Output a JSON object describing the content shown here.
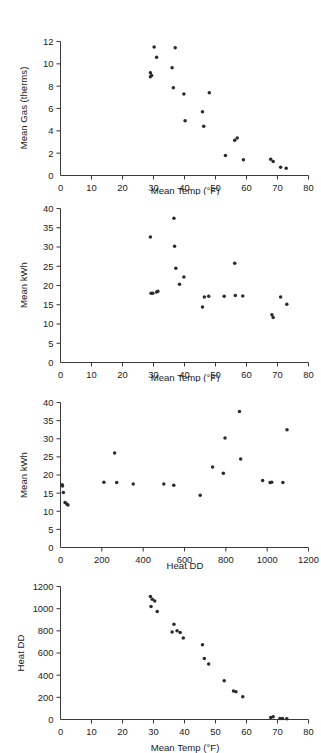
{
  "figure": {
    "name": "four-panel-scatter-figure",
    "background": "#ffffff",
    "point_color": "#2b2b2b",
    "axis_color": "#3a3a3a"
  },
  "chart_data": [
    {
      "type": "scatter",
      "title": "",
      "xlabel": "Mean Temp (°F)",
      "ylabel": "Mean Gas (therms)",
      "xlim": [
        0,
        80
      ],
      "ylim": [
        0,
        12
      ],
      "xticks": [
        0,
        10,
        20,
        30,
        40,
        50,
        60,
        70,
        80
      ],
      "yticks": [
        0,
        2,
        4,
        6,
        8,
        10,
        12
      ],
      "xtick_labels": [
        "0",
        "10",
        "20",
        "30",
        "40",
        "50",
        "60",
        "70",
        "80"
      ],
      "ytick_labels": [
        "0",
        "2",
        "4",
        "6",
        "8",
        "10",
        "12"
      ],
      "grid": false,
      "legend": false,
      "x": [
        29.0,
        29.0,
        29.4,
        30.2,
        31.0,
        36.0,
        36.4,
        37.0,
        39.8,
        40.2,
        45.8,
        46.2,
        48.0,
        53.2,
        56.2,
        57.0,
        59.0,
        67.8,
        68.6,
        71.0,
        72.8
      ],
      "y": [
        9.2,
        8.85,
        8.95,
        11.5,
        10.6,
        9.65,
        7.85,
        11.45,
        7.3,
        4.9,
        5.7,
        4.4,
        7.4,
        1.8,
        3.15,
        3.35,
        1.4,
        1.45,
        1.25,
        0.75,
        0.65
      ]
    },
    {
      "type": "scatter",
      "title": "",
      "xlabel": "Mean Temp (°F)",
      "ylabel": "Mean kWh",
      "xlim": [
        0,
        80
      ],
      "ylim": [
        0,
        40
      ],
      "xticks": [
        0,
        10,
        20,
        30,
        40,
        50,
        60,
        70,
        80
      ],
      "yticks": [
        0,
        5,
        10,
        15,
        20,
        25,
        30,
        35,
        40
      ],
      "xtick_labels": [
        "0",
        "10",
        "20",
        "30",
        "40",
        "50",
        "60",
        "70",
        "80"
      ],
      "ytick_labels": [
        "0",
        "5",
        "10",
        "15",
        "20",
        "25",
        "30",
        "35",
        "40"
      ],
      "grid": false,
      "legend": false,
      "x": [
        29.0,
        29.2,
        29.8,
        31.0,
        31.4,
        36.6,
        36.8,
        37.2,
        38.4,
        39.8,
        45.8,
        46.4,
        47.8,
        52.8,
        56.2,
        56.4,
        58.8,
        68.2,
        68.6,
        71.0,
        73.0
      ],
      "y": [
        32.6,
        18.0,
        18.0,
        18.3,
        18.5,
        37.5,
        30.2,
        24.5,
        20.3,
        22.2,
        14.4,
        17.0,
        17.2,
        17.2,
        25.8,
        17.4,
        17.3,
        12.4,
        11.7,
        17.0,
        15.1
      ]
    },
    {
      "type": "scatter",
      "title": "",
      "xlabel": "Heat DD",
      "ylabel": "Mean kWh",
      "xlim": [
        0,
        1200
      ],
      "ylim": [
        0,
        40
      ],
      "xticks": [
        0,
        200,
        400,
        600,
        800,
        1000,
        1200
      ],
      "yticks": [
        0,
        5,
        10,
        15,
        20,
        25,
        30,
        35,
        40
      ],
      "xtick_labels": [
        "0",
        "200",
        "400",
        "600",
        "800",
        "1000",
        "1200"
      ],
      "ytick_labels": [
        "0",
        "5",
        "10",
        "15",
        "20",
        "25",
        "30",
        "35",
        "40"
      ],
      "grid": false,
      "legend": false,
      "x": [
        8,
        10,
        14,
        22,
        30,
        36,
        210,
        262,
        272,
        352,
        500,
        548,
        676,
        736,
        788,
        796,
        866,
        872,
        978,
        1014,
        1022,
        1076,
        1096
      ],
      "y": [
        17.3,
        17.0,
        15.2,
        12.4,
        12.0,
        11.7,
        18.0,
        26.1,
        17.9,
        17.5,
        17.5,
        17.2,
        14.4,
        22.2,
        20.5,
        30.2,
        37.5,
        24.4,
        18.5,
        17.9,
        18.0,
        17.9,
        32.5
      ]
    },
    {
      "type": "scatter",
      "title": "",
      "xlabel": "Mean Temp (°F)",
      "ylabel": "Heat DD",
      "xlim": [
        0,
        80
      ],
      "ylim": [
        0,
        1200
      ],
      "xticks": [
        0,
        10,
        20,
        30,
        40,
        50,
        60,
        70,
        80
      ],
      "yticks": [
        0,
        200,
        400,
        600,
        800,
        1000,
        1200
      ],
      "xtick_labels": [
        "0",
        "10",
        "20",
        "30",
        "40",
        "50",
        "60",
        "70",
        "80"
      ],
      "ytick_labels": [
        "0",
        "200",
        "400",
        "600",
        "800",
        "1000",
        "1200"
      ],
      "grid": false,
      "legend": false,
      "x": [
        29.0,
        29.2,
        29.6,
        30.4,
        31.2,
        36.0,
        36.6,
        37.6,
        38.6,
        39.6,
        45.8,
        46.4,
        47.8,
        52.8,
        55.8,
        56.6,
        58.8,
        67.8,
        68.6,
        70.8,
        71.6,
        73.0
      ],
      "y": [
        1110,
        1020,
        1085,
        1070,
        975,
        790,
        860,
        800,
        785,
        735,
        675,
        550,
        500,
        350,
        258,
        250,
        205,
        18,
        25,
        8,
        8,
        6
      ]
    }
  ]
}
